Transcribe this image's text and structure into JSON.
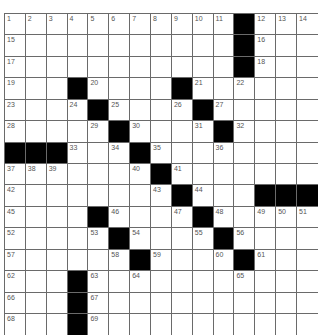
{
  "puzzle": {
    "columns": 15,
    "rows": 15,
    "colors": {
      "grid_line": "#6a6a6a",
      "black_square": "#000000",
      "white_square": "#ffffff",
      "clue_number": "#555555"
    },
    "grid": [
      [
        "1",
        "2",
        "3",
        "4",
        "5",
        "6",
        "7",
        "8",
        "9",
        "10",
        "11",
        "#",
        "12",
        "13",
        "14"
      ],
      [
        "15",
        "",
        "",
        "",
        "",
        "",
        "",
        "",
        "",
        "",
        "",
        "#",
        "16",
        "",
        ""
      ],
      [
        "17",
        "",
        "",
        "",
        "",
        "",
        "",
        "",
        "",
        "",
        "",
        "#",
        "18",
        "",
        ""
      ],
      [
        "19",
        "",
        "",
        "#",
        "20",
        "",
        "",
        "",
        "#",
        "21",
        "",
        "22",
        "",
        "",
        ""
      ],
      [
        "23",
        "",
        "",
        "24",
        "#",
        "25",
        "",
        "",
        "26",
        "#",
        "27",
        "",
        "",
        "",
        ""
      ],
      [
        "28",
        "",
        "",
        "",
        "29",
        "#",
        "30",
        "",
        "",
        "31",
        "#",
        "32",
        "",
        "",
        ""
      ],
      [
        "#",
        "#",
        "#",
        "33",
        "",
        "34",
        "#",
        "35",
        "",
        "",
        "36",
        "",
        "",
        "",
        ""
      ],
      [
        "37",
        "38",
        "39",
        "",
        "",
        "",
        "40",
        "#",
        "41",
        "",
        "",
        "",
        "",
        "",
        ""
      ],
      [
        "42",
        "",
        "",
        "",
        "",
        "",
        "",
        "43",
        "#",
        "44",
        "",
        "",
        "#",
        "#",
        "#"
      ],
      [
        "45",
        "",
        "",
        "",
        "#",
        "46",
        "",
        "",
        "47",
        "#",
        "48",
        "",
        "49",
        "50",
        "51"
      ],
      [
        "52",
        "",
        "",
        "",
        "53",
        "#",
        "54",
        "",
        "",
        "55",
        "#",
        "56",
        "",
        "",
        ""
      ],
      [
        "57",
        "",
        "",
        "",
        "",
        "58",
        "#",
        "59",
        "",
        "",
        "60",
        "#",
        "61",
        "",
        ""
      ],
      [
        "62",
        "",
        "",
        "#",
        "63",
        "",
        "64",
        "",
        "",
        "",
        "",
        "65",
        "",
        "",
        ""
      ],
      [
        "66",
        "",
        "",
        "#",
        "67",
        "",
        "",
        "",
        "",
        "",
        "",
        "",
        "",
        "",
        ""
      ],
      [
        "68",
        "",
        "",
        "#",
        "69",
        "",
        "",
        "",
        "",
        "",
        "",
        "",
        "",
        "",
        ""
      ]
    ]
  }
}
